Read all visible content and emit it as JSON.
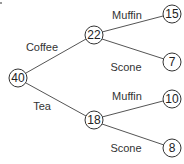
{
  "diagram": {
    "type": "tree",
    "root": {
      "id": "root",
      "value": "40"
    },
    "nodes": [
      {
        "id": "root",
        "value": "40"
      },
      {
        "id": "coffee",
        "value": "22"
      },
      {
        "id": "tea",
        "value": "18"
      },
      {
        "id": "coffee-muffin",
        "value": "15"
      },
      {
        "id": "coffee-scone",
        "value": "7"
      },
      {
        "id": "tea-muffin",
        "value": "10"
      },
      {
        "id": "tea-scone",
        "value": "8"
      }
    ],
    "edges": [
      {
        "from": "root",
        "to": "coffee",
        "label": "Coffee"
      },
      {
        "from": "root",
        "to": "tea",
        "label": "Tea"
      },
      {
        "from": "coffee",
        "to": "coffee-muffin",
        "label": "Muffin"
      },
      {
        "from": "coffee",
        "to": "coffee-scone",
        "label": "Scone"
      },
      {
        "from": "tea",
        "to": "tea-muffin",
        "label": "Muffin"
      },
      {
        "from": "tea",
        "to": "tea-scone",
        "label": "Scone"
      }
    ]
  }
}
